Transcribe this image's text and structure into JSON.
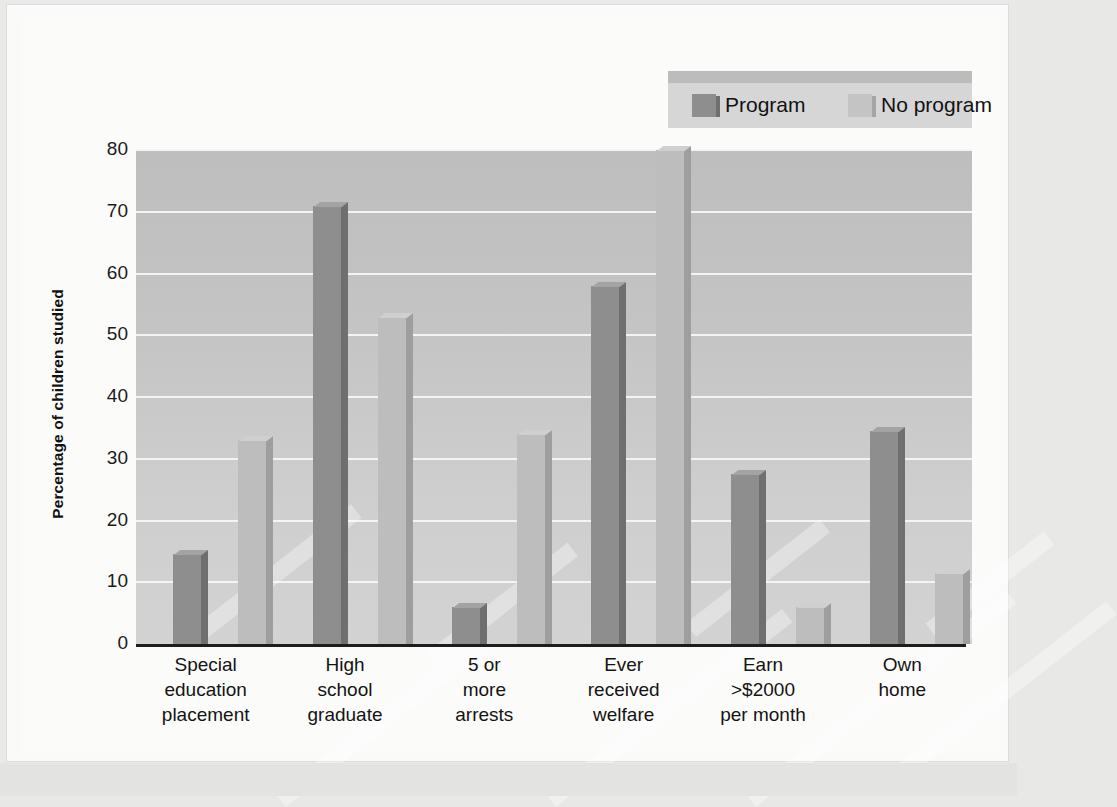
{
  "chart_data": {
    "type": "bar",
    "title": "",
    "xlabel": "",
    "ylabel": "Percentage of children studied",
    "ylim": [
      0,
      80
    ],
    "yticks": [
      0,
      10,
      20,
      30,
      40,
      50,
      60,
      70,
      80
    ],
    "grid": true,
    "legend_position": "top-right",
    "categories": [
      "Special\neducation\nplacement",
      "High\nschool\ngraduate",
      "5 or\nmore\narrests",
      "Ever\nreceived\nwelfare",
      "Earn\n>$2000\nper month",
      "Own\nhome"
    ],
    "series": [
      {
        "name": "Program",
        "color": "#8e8e8e",
        "values": [
          14.5,
          71,
          6,
          58,
          27.5,
          34.5
        ]
      },
      {
        "name": "No program",
        "color": "#bdbdbd",
        "values": [
          33,
          53,
          34,
          80,
          6,
          11.5
        ]
      }
    ]
  },
  "axis": {
    "y_title": "Percentage of children studied",
    "y_ticks": [
      "80",
      "70",
      "60",
      "50",
      "40",
      "30",
      "20",
      "10",
      "0"
    ]
  },
  "legend": {
    "items": [
      {
        "label": "Program"
      },
      {
        "label": "No program"
      }
    ]
  },
  "categories": [
    {
      "line1": "Special",
      "line2": "education",
      "line3": "placement"
    },
    {
      "line1": "High",
      "line2": "school",
      "line3": "graduate"
    },
    {
      "line1": "5 or",
      "line2": "more",
      "line3": "arrests"
    },
    {
      "line1": "Ever",
      "line2": "received",
      "line3": "welfare"
    },
    {
      "line1": "Earn",
      "line2": ">$2000",
      "line3": "per month"
    },
    {
      "line1": "Own",
      "line2": "home",
      "line3": ""
    }
  ],
  "colors": {
    "program": "#8e8e8e",
    "no_program": "#bdbdbd",
    "plot_background": "#c9c9c9",
    "gridline": "#f4f4f4",
    "axis": "#1d1d1d"
  }
}
